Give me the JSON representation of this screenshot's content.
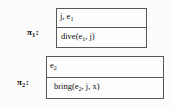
{
  "figure": {
    "type": "plan-frame-diagram",
    "background_color": "#fcfcfb",
    "border_color": "#585858",
    "text_color": "#0b0b0b"
  },
  "frames": [
    {
      "label_base": "π",
      "label_subscript": "1",
      "label_colon": ":",
      "label_full": "π₁:",
      "rows": [
        {
          "role": "variables",
          "text_base": "j, e",
          "text_subscript": "1",
          "text_full": "j, e₁"
        },
        {
          "role": "action",
          "text_base": "dive(e",
          "text_subscript": "1",
          "text_tail": ", j)",
          "text_full": "dive(e₁, j)"
        }
      ]
    },
    {
      "label_base": "π",
      "label_subscript": "2",
      "label_colon": ":",
      "label_full": "π₂:",
      "rows": [
        {
          "role": "variables",
          "text_base": "e",
          "text_subscript": "2",
          "text_full": "e₂"
        },
        {
          "role": "action",
          "text_base": "bring(e",
          "text_subscript": "2",
          "text_tail": ", j, x)",
          "text_full": "bring(e₂, j, x)"
        }
      ]
    }
  ]
}
